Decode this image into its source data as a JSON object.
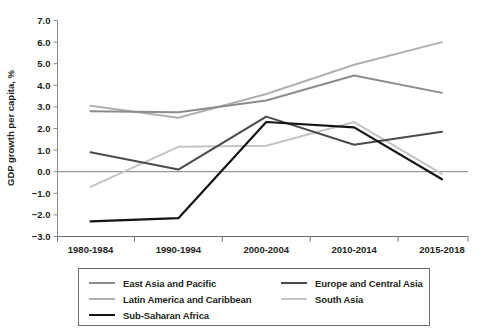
{
  "chart_data": {
    "type": "line",
    "title": "GDP growth per capita, %",
    "xlabel": "",
    "ylabel": "GDP growth per capita, %",
    "categories": [
      "1980-1984",
      "1990-1994",
      "2000-2004",
      "2010-2014",
      "2015-2018"
    ],
    "ylim": [
      -3.0,
      7.0
    ],
    "ytick_labels": [
      "7.0",
      "6.0",
      "5.0",
      "4.0",
      "3.0",
      "2.0",
      "1.0",
      "0.0",
      "−1.0",
      "−2.0",
      "−3.0"
    ],
    "yticks": [
      7.0,
      6.0,
      5.0,
      4.0,
      3.0,
      2.0,
      1.0,
      0.0,
      -1.0,
      -2.0,
      -3.0
    ],
    "grid": false,
    "zero_line": true,
    "legend_position": "bottom",
    "series": [
      {
        "name": "East Asia and Pacific",
        "color": "#8c8c8c",
        "width": 2.0,
        "values": [
          2.8,
          2.75,
          3.3,
          4.45,
          3.65
        ]
      },
      {
        "name": "Europe and Central Asia",
        "color": "#4a4a4a",
        "width": 2.0,
        "values": [
          0.9,
          0.1,
          2.55,
          1.25,
          1.85
        ]
      },
      {
        "name": "Latin America and Caribbean",
        "color": "#b0b0b0",
        "width": 2.0,
        "values": [
          3.05,
          2.5,
          3.6,
          4.95,
          6.0
        ]
      },
      {
        "name": "South Asia",
        "color": "#c4c4c4",
        "width": 2.0,
        "values": [
          -0.7,
          1.15,
          1.2,
          2.3,
          -0.1
        ]
      },
      {
        "name": "Sub-Saharan Africa",
        "color": "#141414",
        "width": 2.2,
        "values": [
          -2.3,
          -2.15,
          2.3,
          2.05,
          -0.35
        ]
      }
    ]
  },
  "legend": {
    "rows": [
      [
        {
          "label": "East Asia and Pacific",
          "color": "#8c8c8c",
          "width": 2.0
        },
        {
          "label": "Europe and Central Asia",
          "color": "#4a4a4a",
          "width": 2.4
        }
      ],
      [
        {
          "label": "Latin America and Caribbean",
          "color": "#b0b0b0",
          "width": 2.0
        },
        {
          "label": "South Asia",
          "color": "#c4c4c4",
          "width": 2.0
        }
      ],
      [
        {
          "label": "Sub-Saharan Africa",
          "color": "#141414",
          "width": 2.6
        }
      ]
    ]
  },
  "axis": {
    "y_title": "GDP growth per capita, %"
  }
}
